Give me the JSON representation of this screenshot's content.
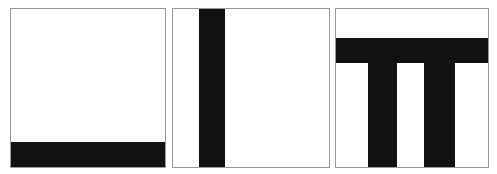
{
  "figure": {
    "background_color": "#ffffff",
    "border_color": "#9a9a9a",
    "shape_color": "#111111",
    "panel_count": 3,
    "canvas": {
      "width": 497,
      "height": 174
    }
  },
  "panels": [
    {
      "id": "panel-1",
      "label": "Panel 1",
      "description": "Empty square with a solid black horizontal bar along the bottom edge",
      "shape_count": 1,
      "shapes": [
        {
          "name": "bottom-bar",
          "orientation": "horizontal",
          "position": "bottom",
          "spans_full_width": true,
          "thickness_px": 25
        }
      ]
    },
    {
      "id": "panel-2",
      "label": "Panel 2",
      "description": "Square with a single solid black vertical bar running top to bottom, left of center",
      "shape_count": 1,
      "shapes": [
        {
          "name": "vertical-bar",
          "orientation": "vertical",
          "position": "left-of-center",
          "spans_full_height": true,
          "thickness_px": 26
        }
      ]
    },
    {
      "id": "panel-3",
      "label": "Panel 3",
      "description": "Square with a black horizontal bar near the top and two vertical bars descending from it to the bottom edge, forming a pi-like shape",
      "shape_count": 3,
      "shapes": [
        {
          "name": "top-bar",
          "orientation": "horizontal",
          "position": "upper",
          "spans_full_width": true,
          "thickness_px": 25
        },
        {
          "name": "leg-left",
          "orientation": "vertical",
          "position": "left-leg",
          "spans_full_height": false,
          "thickness_px": 29
        },
        {
          "name": "leg-right",
          "orientation": "vertical",
          "position": "right-leg",
          "spans_full_height": false,
          "thickness_px": 31
        }
      ]
    }
  ]
}
